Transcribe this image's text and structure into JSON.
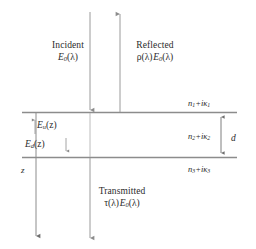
{
  "figure": {
    "colors": {
      "line": "#8c8c8c",
      "text": "#2b2b2b",
      "background": "#ffffff"
    }
  },
  "rays": {
    "incident": {
      "label": "Incident",
      "field_E": "E",
      "field_sub": "0",
      "field_arg": "(λ)",
      "direction": "down"
    },
    "reflected": {
      "label": "Reflected",
      "coeff": "ρ(λ)",
      "field_E": "E",
      "field_sub": "0",
      "field_arg": "(λ)",
      "direction": "up"
    },
    "transmitted": {
      "label": "Transmitted",
      "coeff": "τ(λ)",
      "field_E": "E",
      "field_sub": "0",
      "field_arg": "(λ)",
      "direction": "down"
    }
  },
  "internal_fields": {
    "up": {
      "symbol": "E",
      "subscript": "u",
      "argument": "(z)",
      "arrow": "↑"
    },
    "down": {
      "symbol": "E",
      "subscript": "d",
      "argument": "(z)",
      "arrow": "↓"
    }
  },
  "layers": [
    {
      "name": "layer-1",
      "index_n": "n",
      "index_sub": "1",
      "plus": "+",
      "i": "i",
      "kappa": "κ",
      "kappa_sub": "1"
    },
    {
      "name": "layer-2",
      "index_n": "n",
      "index_sub": "2",
      "plus": "+",
      "i": "i",
      "kappa": "κ",
      "kappa_sub": "2"
    },
    {
      "name": "layer-3",
      "index_n": "n",
      "index_sub": "3",
      "plus": "+",
      "i": "i",
      "kappa": "κ",
      "kappa_sub": "3"
    }
  ],
  "thickness": {
    "label": "d"
  },
  "axis": {
    "label": "z",
    "direction": "down"
  }
}
